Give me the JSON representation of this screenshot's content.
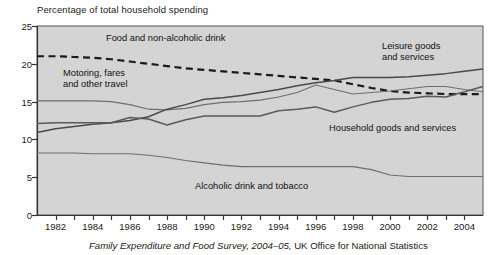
{
  "chart_data": {
    "type": "line",
    "title": "",
    "ylabel": "Percentage of total household spending",
    "xlabel": "",
    "ylim": [
      0,
      25
    ],
    "xlim": [
      1981,
      2005
    ],
    "yticks": [
      0,
      5,
      10,
      15,
      20,
      25
    ],
    "xticks": [
      1982,
      1984,
      1986,
      1988,
      1990,
      1992,
      1994,
      1996,
      1998,
      2000,
      2002,
      2004
    ],
    "x": [
      1981,
      1982,
      1983,
      1984,
      1985,
      1986,
      1987,
      1988,
      1989,
      1990,
      1991,
      1992,
      1993,
      1994,
      1995,
      1996,
      1997,
      1998,
      1999,
      2000,
      2001,
      2002,
      2003,
      2004,
      2005
    ],
    "grid": false,
    "legend_position": "inline-annotations",
    "plot_background": "#d4d4d4",
    "series": [
      {
        "name": "Food and non-alcoholic drink",
        "style": "dashed",
        "color": "#1a1a1a",
        "width": 2.2,
        "values": [
          21.0,
          21.0,
          20.9,
          20.8,
          20.6,
          20.3,
          20.0,
          19.7,
          19.4,
          19.2,
          19.0,
          18.8,
          18.6,
          18.4,
          18.2,
          18.0,
          17.8,
          17.3,
          16.8,
          16.4,
          16.2,
          16.1,
          16.0,
          16.0,
          16.0
        ]
      },
      {
        "name": "Motoring, fares and other travel",
        "style": "solid",
        "color": "#6e6e6e",
        "width": 1.1,
        "values": [
          15.1,
          15.1,
          15.1,
          15.1,
          15.0,
          14.6,
          14.0,
          13.9,
          14.1,
          14.6,
          14.9,
          15.0,
          15.2,
          15.6,
          16.2,
          17.2,
          16.6,
          16.0,
          16.2,
          16.4,
          16.7,
          17.0,
          17.0,
          16.6,
          16.3
        ]
      },
      {
        "name": "Leisure goods and services",
        "style": "solid",
        "color": "#4a4a4a",
        "width": 1.5,
        "values": [
          10.9,
          11.4,
          11.7,
          12.0,
          12.2,
          12.5,
          13.0,
          14.0,
          14.6,
          15.3,
          15.5,
          15.8,
          16.2,
          16.6,
          17.1,
          17.5,
          17.8,
          18.2,
          18.2,
          18.2,
          18.3,
          18.5,
          18.7,
          19.0,
          19.3
        ]
      },
      {
        "name": "Household goods and services",
        "style": "solid",
        "color": "#5a5a5a",
        "width": 1.5,
        "values": [
          12.1,
          12.2,
          12.2,
          12.2,
          12.2,
          12.9,
          12.7,
          11.9,
          12.6,
          13.1,
          13.1,
          13.1,
          13.1,
          13.8,
          14.0,
          14.3,
          13.6,
          14.3,
          14.9,
          15.3,
          15.4,
          15.7,
          15.6,
          16.3,
          17.0
        ]
      },
      {
        "name": "Alcoholic drink and tobacco",
        "style": "solid",
        "color": "#6e6e6e",
        "width": 1.1,
        "values": [
          8.2,
          8.2,
          8.2,
          8.1,
          8.1,
          8.1,
          7.9,
          7.6,
          7.2,
          6.9,
          6.6,
          6.4,
          6.4,
          6.4,
          6.4,
          6.4,
          6.4,
          6.4,
          6.0,
          5.3,
          5.1,
          5.1,
          5.1,
          5.1,
          5.1
        ]
      }
    ],
    "annotations": [
      {
        "text": "Food and non-alcoholic drink",
        "x": 106,
        "y": 34,
        "lines": [
          "Food and non-alcoholic drink"
        ]
      },
      {
        "text": "Motoring, fares and other travel",
        "x": 63,
        "y": 69,
        "lines": [
          "Motoring, fares",
          "and other travel"
        ]
      },
      {
        "text": "Leisure goods and services",
        "x": 382,
        "y": 42,
        "lines": [
          "Leisure goods",
          "and services"
        ]
      },
      {
        "text": "Household goods and services",
        "x": 329,
        "y": 124,
        "lines": [
          "Household goods and services"
        ]
      },
      {
        "text": "Alcoholic drink and tobacco",
        "x": 195,
        "y": 182,
        "lines": [
          "Alcoholic drink and tobacco"
        ]
      }
    ]
  },
  "axis_title": "Percentage of total household spending",
  "ytick_labels": [
    "0",
    "5",
    "10",
    "15",
    "20",
    "25"
  ],
  "xtick_labels": [
    "1982",
    "1984",
    "1986",
    "1988",
    "1990",
    "1992",
    "1994",
    "1996",
    "1998",
    "2000",
    "2002",
    "2004"
  ],
  "annotation_labels": {
    "food_line1": "Food and non-alcoholic drink",
    "motoring_line1": "Motoring, fares",
    "motoring_line2": "and other travel",
    "leisure_line1": "Leisure goods",
    "leisure_line2": "and services",
    "household_line1": "Household goods and services",
    "alcohol_line1": "Alcoholic drink and tobacco"
  },
  "source": {
    "italic_part": "Family Expenditure and Food Survey, 2004–05,",
    "roman_part": " UK Office for National Statistics"
  }
}
